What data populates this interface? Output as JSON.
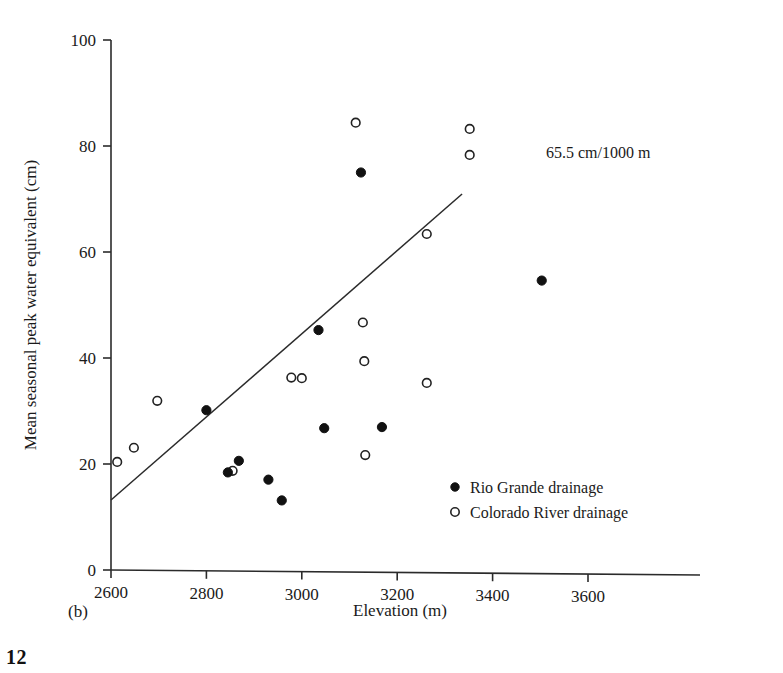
{
  "figure": {
    "panel_label": "(b)",
    "page_number": "12",
    "annotation": "65.5 cm/1000 m"
  },
  "chart_data": {
    "type": "scatter",
    "title": "",
    "xlabel": "Elevation (m)",
    "ylabel": "Mean seasonal peak water equivalent (cm)",
    "xlim": [
      2600,
      3700
    ],
    "ylim": [
      0,
      100
    ],
    "xticks": [
      2600,
      2800,
      3000,
      3200,
      3400,
      3600
    ],
    "yticks": [
      0,
      20,
      40,
      60,
      80,
      100
    ],
    "xtick_labels": [
      "2600",
      "2800",
      "3000",
      "3200",
      "3400",
      "3600"
    ],
    "ytick_labels": [
      "0",
      "20",
      "40",
      "60",
      "80",
      "100"
    ],
    "grid": false,
    "legend_position": "inside-lower-right",
    "series": [
      {
        "name": "Rio Grande drainage",
        "marker": "filled-circle",
        "color": "#111111",
        "points": [
          [
            2800,
            30.3
          ],
          [
            2845,
            18.6
          ],
          [
            2868,
            20.8
          ],
          [
            2930,
            17.3
          ],
          [
            2958,
            13.4
          ],
          [
            3035,
            45.6
          ],
          [
            3047,
            27.1
          ],
          [
            3124,
            75.4
          ],
          [
            3168,
            27.4
          ],
          [
            3503,
            55.3
          ]
        ]
      },
      {
        "name": "Colorado River drainage",
        "marker": "open-circle",
        "color": "#ffffff",
        "points": [
          [
            2613,
            20.4
          ],
          [
            2648,
            23.1
          ],
          [
            2697,
            32.0
          ],
          [
            2855,
            18.9
          ],
          [
            2978,
            36.6
          ],
          [
            3000,
            36.5
          ],
          [
            3113,
            84.8
          ],
          [
            3128,
            47.1
          ],
          [
            3131,
            39.8
          ],
          [
            3133,
            22.1
          ],
          [
            3262,
            63.9
          ],
          [
            3262,
            35.8
          ],
          [
            3352,
            83.8
          ],
          [
            3352,
            78.9
          ]
        ]
      }
    ],
    "fit_line": {
      "label": "65.5 cm/1000 m",
      "slope_cm_per_1000m": 65.5,
      "x_start": 2600,
      "y_start": 13.2,
      "x_end": 3336,
      "y_end": 71.5
    }
  },
  "legend": {
    "items": [
      {
        "marker": "filled-circle",
        "label": "Rio Grande drainage"
      },
      {
        "marker": "open-circle",
        "label": "Colorado River drainage"
      }
    ]
  }
}
